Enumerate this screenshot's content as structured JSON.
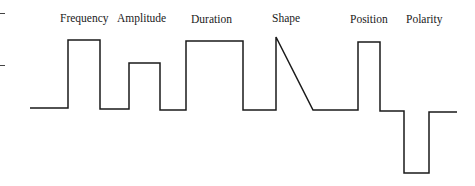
{
  "diagram": {
    "labels": [
      {
        "text": "Frequency",
        "x": 60,
        "y": 14
      },
      {
        "text": "Amplitude",
        "x": 117,
        "y": 14
      },
      {
        "text": "Duration",
        "x": 190,
        "y": 14
      },
      {
        "text": "Shape",
        "x": 272,
        "y": 14
      },
      {
        "text": "Position",
        "x": 350,
        "y": 14
      },
      {
        "text": "Polarity",
        "x": 405,
        "y": 14
      }
    ],
    "line_color": "#1a1a1a",
    "waveform": [
      [
        30,
        108
      ],
      [
        68,
        108
      ],
      [
        68,
        40
      ],
      [
        100,
        40
      ],
      [
        100,
        109
      ],
      [
        129,
        109
      ],
      [
        129,
        63
      ],
      [
        160,
        63
      ],
      [
        160,
        110
      ],
      [
        186,
        110
      ],
      [
        186,
        41
      ],
      [
        243,
        41
      ],
      [
        243,
        110
      ],
      [
        276,
        110
      ],
      [
        276,
        37
      ],
      [
        313,
        110
      ],
      [
        358,
        110
      ],
      [
        358,
        42
      ],
      [
        380,
        42
      ],
      [
        380,
        111
      ],
      [
        404,
        111
      ],
      [
        404,
        173
      ],
      [
        429,
        173
      ],
      [
        429,
        112
      ],
      [
        457,
        112
      ]
    ],
    "left_ticks": [
      13,
      65
    ]
  }
}
